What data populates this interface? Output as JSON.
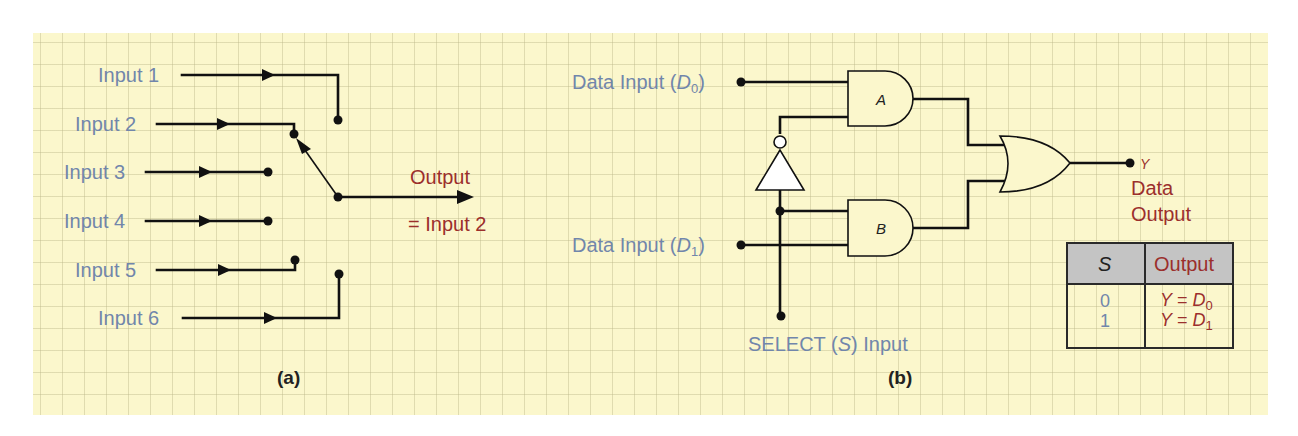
{
  "figure_a": {
    "caption": "(a)",
    "inputs": [
      {
        "label": "Input 1"
      },
      {
        "label": "Input 2"
      },
      {
        "label": "Input 3"
      },
      {
        "label": "Input 4"
      },
      {
        "label": "Input 5"
      },
      {
        "label": "Input 6"
      }
    ],
    "output_label": "Output",
    "output_value": "= Input 2",
    "selected_input": 2
  },
  "figure_b": {
    "caption": "(b)",
    "data_input_0": {
      "prefix": "Data Input (",
      "var": "D",
      "sub": "0",
      "suffix": ")"
    },
    "data_input_1": {
      "prefix": "Data Input (",
      "var": "D",
      "sub": "1",
      "suffix": ")"
    },
    "select_input": {
      "prefix": "SELECT (",
      "var": "S",
      "suffix": ") Input"
    },
    "gate_a_label": "A",
    "gate_b_label": "B",
    "output_var": "Y",
    "output_line1": "Data",
    "output_line2": "Output",
    "truth_table": {
      "headers": {
        "select": "S",
        "output": "Output"
      },
      "rows": [
        {
          "s": "0",
          "out_var": "Y",
          "eq": " = ",
          "d_var": "D",
          "d_sub": "0"
        },
        {
          "s": "1",
          "out_var": "Y",
          "eq": " = ",
          "d_var": "D",
          "d_sub": "1"
        }
      ]
    }
  },
  "colors": {
    "background": "#fbf7cc",
    "grid": "#dcd8a8",
    "label_blue": "#7186ab",
    "output_red": "#9b2f2c",
    "wire": "#111111",
    "table_header": "#c4c4c4"
  }
}
